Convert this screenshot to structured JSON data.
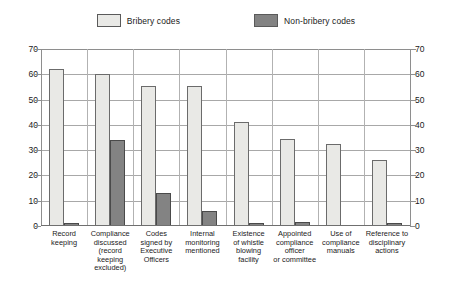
{
  "chart_data": {
    "type": "bar",
    "title": "",
    "subtitle": "",
    "xlabel": "",
    "ylabel": "",
    "ylim": [
      0,
      70
    ],
    "ytick_step": 10,
    "yticks": [
      0,
      10,
      20,
      30,
      40,
      50,
      60,
      70
    ],
    "grid": true,
    "dual_y_axis": true,
    "legend_position": "top-center",
    "categories": [
      "Record\nkeeping",
      "Compliance\ndiscussed\n(record keeping\nexcluded)",
      "Codes\nsigned by\nExecutive\nOfficers",
      "Internal\nmonitoring\nmentioned",
      "Existence\nof whistle\nblowing\nfacility",
      "Appointed\ncompliance\nofficer\nor committee",
      "Use of\ncompliance\nmanuals",
      "Reference to\ndisciplinary\nactions"
    ],
    "series": [
      {
        "name": "Bribery codes",
        "color": "#e9e9e6",
        "values": [
          62,
          60,
          55.5,
          55.5,
          41,
          34.5,
          32.5,
          26
        ]
      },
      {
        "name": "Non-bribery codes",
        "color": "#838383",
        "values": [
          1,
          34,
          13,
          6,
          1,
          1.5,
          0,
          1
        ]
      }
    ]
  },
  "legend": {
    "items": [
      {
        "label": "Bribery codes",
        "swatch": "light-swatch-icon"
      },
      {
        "label": "Non-bribery codes",
        "swatch": "dark-swatch-icon"
      }
    ]
  },
  "axis": {
    "left_ticks": [
      "70",
      "60",
      "50",
      "40",
      "30",
      "20",
      "10",
      "0"
    ],
    "right_ticks": [
      "70",
      "60",
      "50",
      "40",
      "30",
      "20",
      "10",
      "0"
    ]
  }
}
